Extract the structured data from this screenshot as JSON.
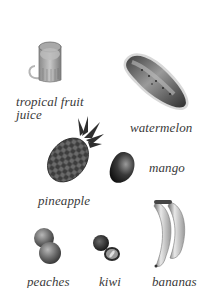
{
  "page": {
    "background": "#ffffff",
    "style": "grayscale vocabulary picture card"
  },
  "items": [
    {
      "id": "juice",
      "label_line1": "tropical fruit",
      "label_line2": "juice",
      "icon": "juice-jug-icon"
    },
    {
      "id": "watermelon",
      "label": "watermelon",
      "icon": "watermelon-icon"
    },
    {
      "id": "pineapple",
      "label": "pineapple",
      "icon": "pineapple-icon"
    },
    {
      "id": "mango",
      "label": "mango",
      "icon": "mango-icon"
    },
    {
      "id": "peaches",
      "label": "peaches",
      "icon": "peaches-icon"
    },
    {
      "id": "kiwi",
      "label": "kiwi",
      "icon": "kiwi-icon"
    },
    {
      "id": "bananas",
      "label": "bananas",
      "icon": "bananas-icon"
    }
  ]
}
